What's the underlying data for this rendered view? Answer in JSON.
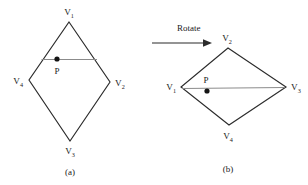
{
  "figure": {
    "operation": {
      "label": "Rotate",
      "arrow_icon": "arrow-right-icon"
    },
    "panels": [
      {
        "id": "a",
        "caption": "(a)",
        "shape": "kite",
        "interior_point": {
          "label": "P",
          "marker": "dot"
        },
        "vertices": [
          {
            "label": "V",
            "subscript": "1",
            "position": "top"
          },
          {
            "label": "V",
            "subscript": "2",
            "position": "right"
          },
          {
            "label": "V",
            "subscript": "3",
            "position": "bottom"
          },
          {
            "label": "V",
            "subscript": "4",
            "position": "left"
          }
        ]
      },
      {
        "id": "b",
        "caption": "(b)",
        "shape": "kite",
        "interior_point": {
          "label": "P",
          "marker": "dot"
        },
        "vertices": [
          {
            "label": "V",
            "subscript": "2",
            "position": "top"
          },
          {
            "label": "V",
            "subscript": "3",
            "position": "right"
          },
          {
            "label": "V",
            "subscript": "4",
            "position": "bottom"
          },
          {
            "label": "V",
            "subscript": "1",
            "position": "left"
          }
        ]
      }
    ],
    "colors": {
      "outline": "#2b2b2b",
      "chord": "#8b8b8b",
      "dot": "#141414",
      "text": "#1a1a1a",
      "background": "#ffffff"
    }
  }
}
